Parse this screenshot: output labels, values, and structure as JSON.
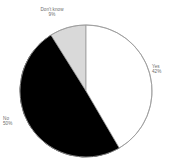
{
  "chart_data": {
    "type": "pie",
    "title": "",
    "subtitle": "",
    "xlabel": "",
    "ylabel": "",
    "legend_position": "none",
    "grid": false,
    "labels_outside": true,
    "start_angle_deg": 0,
    "direction": "clockwise",
    "categories": [
      "Yes",
      "No",
      "Don't know"
    ],
    "values": [
      42,
      50,
      9
    ],
    "value_suffix": "%",
    "slices": [
      {
        "name": "Yes",
        "label": "Yes",
        "value": 42,
        "percent_text": "42%",
        "color": "#ffffff",
        "stroke": "#9a9a9a",
        "start_deg": 0,
        "end_deg": 151.2,
        "label_position": "right"
      },
      {
        "name": "No",
        "label": "No",
        "value": 50,
        "percent_text": "50%",
        "color": "#000000",
        "stroke": "#000000",
        "start_deg": 151.2,
        "end_deg": 331.2,
        "label_position": "left"
      },
      {
        "name": "Don't know",
        "label": "Don't know",
        "value": 9,
        "percent_text": "9%",
        "color": "#d9d9d9",
        "stroke": "#9a9a9a",
        "start_deg": 331.2,
        "end_deg": 360,
        "label_position": "top"
      }
    ],
    "geometry": {
      "center_x": 86,
      "center_y": 91,
      "radius": 66
    },
    "colors": {
      "background": "#ffffff",
      "label_text": "#6d6d6d",
      "outline": "#9a9a9a",
      "yes_fill": "#ffffff",
      "no_fill": "#000000",
      "dontknow_fill": "#d9d9d9"
    }
  }
}
